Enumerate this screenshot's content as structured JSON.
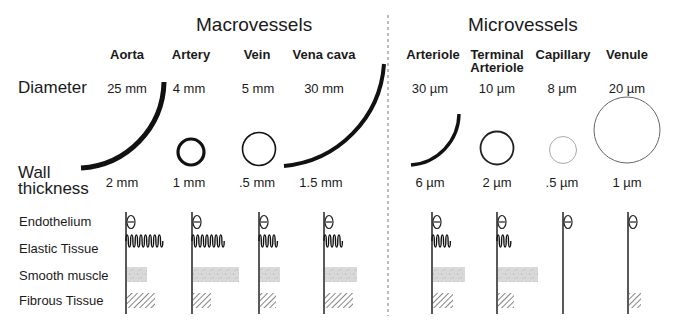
{
  "sections": {
    "macro": {
      "title": "Macrovessels"
    },
    "micro": {
      "title": "Microvessels"
    }
  },
  "row_labels": {
    "diameter": "Diameter",
    "wall_thickness_line1": "Wall",
    "wall_thickness_line2": "thickness"
  },
  "tissue_labels": [
    "Endothelium",
    "Elastic Tissue",
    "Smooth muscle",
    "Fibrous Tissue"
  ],
  "vessels": [
    {
      "name": "Aorta",
      "name2": "",
      "diameter": "25 mm",
      "wall": "2 mm",
      "group": "macro",
      "layers": {
        "endothelium": true,
        "elastic_waves": 8,
        "smooth_muscle_width": 20,
        "fibrous_width": 28
      }
    },
    {
      "name": "Artery",
      "name2": "",
      "diameter": "4 mm",
      "wall": "1 mm",
      "group": "macro",
      "layers": {
        "endothelium": true,
        "elastic_waves": 7,
        "smooth_muscle_width": 46,
        "fibrous_width": 18
      }
    },
    {
      "name": "Vein",
      "name2": "",
      "diameter": "5 mm",
      "wall": ".5 mm",
      "group": "macro",
      "layers": {
        "endothelium": true,
        "elastic_waves": 4,
        "smooth_muscle_width": 20,
        "fibrous_width": 16
      }
    },
    {
      "name": "Vena cava",
      "name2": "",
      "diameter": "30 mm",
      "wall": "1.5 mm",
      "group": "macro",
      "layers": {
        "endothelium": true,
        "elastic_waves": 4,
        "smooth_muscle_width": 32,
        "fibrous_width": 28
      }
    },
    {
      "name": "Arteriole",
      "name2": "",
      "diameter": "30 µm",
      "wall": "6 µm",
      "group": "micro",
      "layers": {
        "endothelium": true,
        "elastic_waves": 4,
        "smooth_muscle_width": 32,
        "fibrous_width": 20
      }
    },
    {
      "name": "Terminal",
      "name2": "Arteriole",
      "diameter": "10 µm",
      "wall": "2 µm",
      "group": "micro",
      "layers": {
        "endothelium": true,
        "elastic_waves": 3,
        "smooth_muscle_width": 40,
        "fibrous_width": 16
      }
    },
    {
      "name": "Capillary",
      "name2": "",
      "diameter": "8 µm",
      "wall": ".5 µm",
      "group": "micro",
      "layers": {
        "endothelium": true,
        "elastic_waves": 0,
        "smooth_muscle_width": 0,
        "fibrous_width": 0
      }
    },
    {
      "name": "Venule",
      "name2": "",
      "diameter": "20 µm",
      "wall": "1 µm",
      "group": "micro",
      "layers": {
        "endothelium": true,
        "elastic_waves": 0,
        "smooth_muscle_width": 0,
        "fibrous_width": 12
      }
    }
  ],
  "colors": {
    "ink": "#1a1a1a",
    "smooth_muscle": "#d6d6d6",
    "divider": "#777777"
  }
}
